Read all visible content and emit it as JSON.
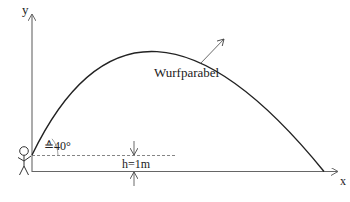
{
  "diagram": {
    "title": "Wurfparabel",
    "axes": {
      "x_label": "x",
      "y_label": "y"
    },
    "curve_label": "Wurfparabel",
    "angle_label": "≙40°",
    "height_label": "h=1m",
    "launch_angle_deg": 40,
    "launch_height_m": 1,
    "colors": {
      "curve": "#222222",
      "axes": "#666666",
      "dashed": "#777777",
      "text": "#222222"
    }
  }
}
